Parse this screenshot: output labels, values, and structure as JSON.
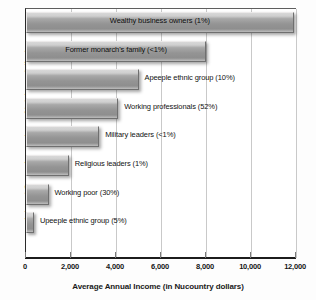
{
  "chart_data": {
    "type": "bar",
    "orientation": "horizontal",
    "title": "",
    "xlabel": "Average Annual Income (in Nucountry dollars)",
    "ylabel": "Interest Group (percentage of total population)",
    "xlim": [
      0,
      12000
    ],
    "xticks": [
      0,
      2000,
      4000,
      6000,
      8000,
      10000,
      12000
    ],
    "xtick_labels": [
      "0",
      "2,000",
      "4,000",
      "6,000",
      "8,000",
      "10,000",
      "12,000"
    ],
    "grid": "vertical",
    "legend": "none",
    "categories": [
      "Wealthy business owners (1%)",
      "Former monarch's family (<1%)",
      "Apeeple ethnic group (10%)",
      "Working professionals (52%)",
      "Military leaders (<1%)",
      "Religious leaders (1%)",
      "Working poor (30%)",
      "Upeeple ethnic group (5%)"
    ],
    "values": [
      11900,
      8000,
      5000,
      4100,
      3250,
      1900,
      1000,
      350
    ],
    "bars": [
      {
        "label": "Wealthy business owners (1%)",
        "value": 11900,
        "label_position": "inside"
      },
      {
        "label": "Former monarch's family (<1%)",
        "value": 8000,
        "label_position": "inside"
      },
      {
        "label": "Apeeple ethnic group (10%)",
        "value": 5000,
        "label_position": "outside"
      },
      {
        "label": "Working professionals (52%)",
        "value": 4100,
        "label_position": "outside"
      },
      {
        "label": "Military leaders (<1%)",
        "value": 3250,
        "label_position": "outside"
      },
      {
        "label": "Religious leaders (1%)",
        "value": 1900,
        "label_position": "outside"
      },
      {
        "label": "Working poor (30%)",
        "value": 1000,
        "label_position": "outside"
      },
      {
        "label": "Upeeple ethnic group (5%)",
        "value": 350,
        "label_position": "outside"
      }
    ],
    "colors": {
      "bar_fill": "#9a9a9a",
      "bar_highlight": "#d8d8d8",
      "bar_shadow": "#6f6f6f",
      "axis": "#1c1c1c",
      "gridline": "#c9c9c9",
      "background": "#ffffff",
      "text": "#161616"
    }
  }
}
